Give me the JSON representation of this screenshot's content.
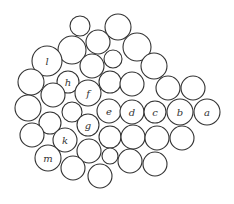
{
  "diagram": {
    "type": "circle-packing",
    "stroke_color": "#333333",
    "background": "#ffffff",
    "circles": [
      {
        "cx": 80,
        "cy": 26,
        "r": 10,
        "label": ""
      },
      {
        "cx": 118,
        "cy": 27,
        "r": 13,
        "label": ""
      },
      {
        "cx": 72,
        "cy": 50,
        "r": 14,
        "label": ""
      },
      {
        "cx": 98,
        "cy": 42,
        "r": 12,
        "label": ""
      },
      {
        "cx": 137,
        "cy": 47,
        "r": 14,
        "label": ""
      },
      {
        "cx": 47,
        "cy": 61,
        "r": 15,
        "label": "l"
      },
      {
        "cx": 92,
        "cy": 66,
        "r": 12,
        "label": ""
      },
      {
        "cx": 113,
        "cy": 59,
        "r": 9,
        "label": ""
      },
      {
        "cx": 154,
        "cy": 66,
        "r": 13,
        "label": ""
      },
      {
        "cx": 68,
        "cy": 82,
        "r": 11,
        "label": "h"
      },
      {
        "cx": 31,
        "cy": 82,
        "r": 13,
        "label": ""
      },
      {
        "cx": 110,
        "cy": 82,
        "r": 11,
        "label": ""
      },
      {
        "cx": 132,
        "cy": 84,
        "r": 12,
        "label": ""
      },
      {
        "cx": 168,
        "cy": 88,
        "r": 12,
        "label": ""
      },
      {
        "cx": 193,
        "cy": 88,
        "r": 12,
        "label": ""
      },
      {
        "cx": 53,
        "cy": 95,
        "r": 12,
        "label": ""
      },
      {
        "cx": 88,
        "cy": 93,
        "r": 13,
        "label": "f"
      },
      {
        "cx": 28,
        "cy": 108,
        "r": 13,
        "label": ""
      },
      {
        "cx": 72,
        "cy": 112,
        "r": 10,
        "label": ""
      },
      {
        "cx": 109,
        "cy": 111,
        "r": 12,
        "label": "e"
      },
      {
        "cx": 132,
        "cy": 112,
        "r": 12,
        "label": "d"
      },
      {
        "cx": 155,
        "cy": 112,
        "r": 11,
        "label": "c"
      },
      {
        "cx": 180,
        "cy": 112,
        "r": 13,
        "label": "b"
      },
      {
        "cx": 207,
        "cy": 112,
        "r": 13,
        "label": "a"
      },
      {
        "cx": 50,
        "cy": 123,
        "r": 11,
        "label": ""
      },
      {
        "cx": 88,
        "cy": 125,
        "r": 11,
        "label": "g"
      },
      {
        "cx": 32,
        "cy": 135,
        "r": 12,
        "label": ""
      },
      {
        "cx": 65,
        "cy": 140,
        "r": 12,
        "label": "k"
      },
      {
        "cx": 110,
        "cy": 137,
        "r": 11,
        "label": ""
      },
      {
        "cx": 133,
        "cy": 137,
        "r": 12,
        "label": ""
      },
      {
        "cx": 157,
        "cy": 138,
        "r": 12,
        "label": ""
      },
      {
        "cx": 182,
        "cy": 138,
        "r": 12,
        "label": ""
      },
      {
        "cx": 89,
        "cy": 151,
        "r": 12,
        "label": ""
      },
      {
        "cx": 110,
        "cy": 156,
        "r": 8,
        "label": ""
      },
      {
        "cx": 130,
        "cy": 161,
        "r": 12,
        "label": ""
      },
      {
        "cx": 155,
        "cy": 164,
        "r": 12,
        "label": ""
      },
      {
        "cx": 48,
        "cy": 158,
        "r": 13,
        "label": "m"
      },
      {
        "cx": 73,
        "cy": 168,
        "r": 12,
        "label": ""
      },
      {
        "cx": 100,
        "cy": 176,
        "r": 12,
        "label": ""
      }
    ],
    "labels": [
      "a",
      "b",
      "c",
      "d",
      "e",
      "f",
      "g",
      "h",
      "k",
      "l",
      "m"
    ]
  }
}
